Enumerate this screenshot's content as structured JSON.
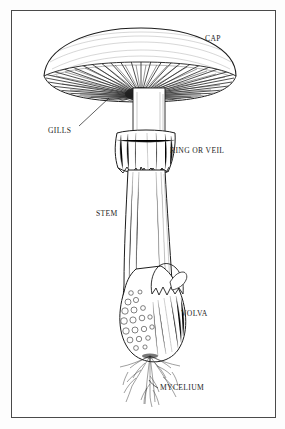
{
  "figure": {
    "kind": "mushroom-anatomy-diagram",
    "style": "black-and-white pen-and-ink line engraving",
    "background_color": "#ffffff",
    "ink_color": "#1d1d1d",
    "frame": {
      "present": true,
      "color": "#4a4a4a",
      "stroke_width": 1
    },
    "labels": [
      {
        "id": "cap",
        "text": "CAP",
        "x": 205,
        "y": 35,
        "points_to": "cap",
        "leader_line": false
      },
      {
        "id": "gills",
        "text": "GILLS",
        "x": 48,
        "y": 127,
        "points_to": "gills",
        "leader_line": true
      },
      {
        "id": "ring",
        "text": "RING OR VEIL",
        "x": 170,
        "y": 147,
        "points_to": "ring-or-veil",
        "leader_line": false
      },
      {
        "id": "stem",
        "text": "STEM",
        "x": 96,
        "y": 210,
        "points_to": "stem",
        "leader_line": false
      },
      {
        "id": "volva",
        "text": "VOLVA",
        "x": 181,
        "y": 310,
        "points_to": "volva",
        "leader_line": false
      },
      {
        "id": "mycelium",
        "text": "MYCELIUM",
        "x": 160,
        "y": 384,
        "points_to": "mycelium",
        "leader_line": true
      }
    ],
    "parts": [
      {
        "id": "cap",
        "name": "Cap",
        "description": "broad domed pileus spanning the upper width of the drawing"
      },
      {
        "id": "gills",
        "name": "Gills",
        "description": "dense radiating lamellae beneath the cap"
      },
      {
        "id": "ring-or-veil",
        "name": "Ring or Veil",
        "description": "skirt-like annulus hanging around the upper stem"
      },
      {
        "id": "stem",
        "name": "Stem",
        "description": "tall tapering stipe running down the centre"
      },
      {
        "id": "volva",
        "name": "Volva",
        "description": "bulbous warted cup at the base of the stem"
      },
      {
        "id": "mycelium",
        "name": "Mycelium",
        "description": "fine thread-like hyphae spreading below the volva"
      }
    ]
  }
}
